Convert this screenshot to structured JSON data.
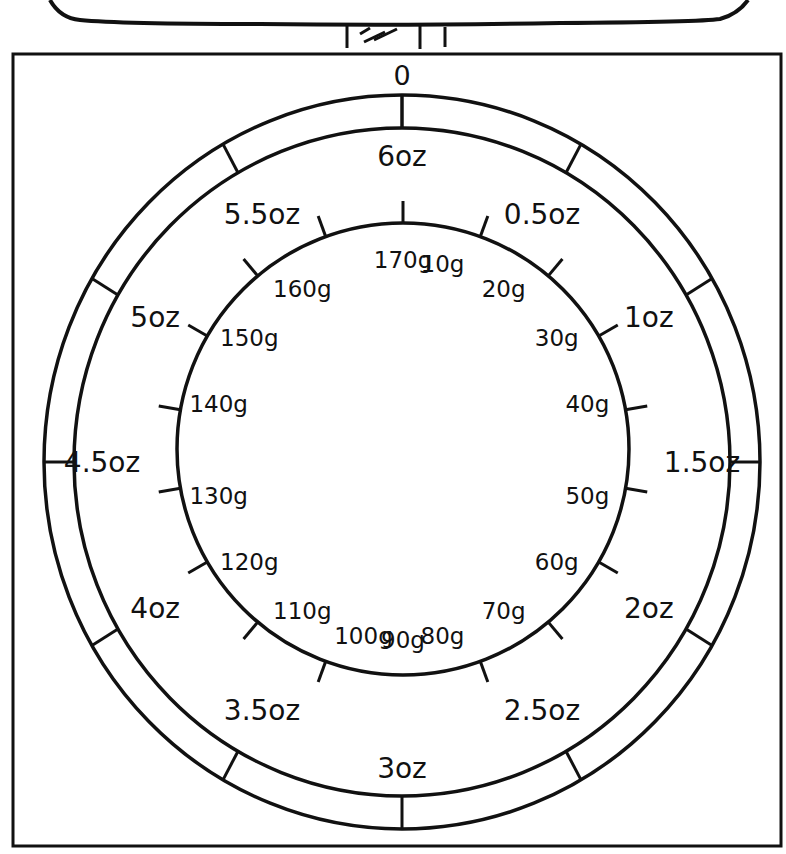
{
  "diagram": {
    "type": "kitchen-scale-dial",
    "zero_label": "0",
    "colors": {
      "ink": "#111111",
      "background": "#ffffff"
    },
    "outer_scale": {
      "unit": "oz",
      "labels": [
        "6oz",
        "0.5oz",
        "1oz",
        "1.5oz",
        "2oz",
        "2.5oz",
        "3oz",
        "3.5oz",
        "4oz",
        "4.5oz",
        "5oz",
        "5.5oz"
      ],
      "label_angles_deg": [
        0,
        30,
        60,
        90,
        120,
        150,
        180,
        210,
        240,
        270,
        300,
        330
      ],
      "tick_angles_deg": [
        0,
        30,
        60,
        90,
        120,
        150,
        180,
        210,
        240,
        270,
        300,
        330
      ]
    },
    "inner_scale": {
      "unit": "g",
      "labels": [
        "170g",
        "10g",
        "20g",
        "30g",
        "40g",
        "50g",
        "60g",
        "70g",
        "80g",
        "90g",
        "100g",
        "110g",
        "120g",
        "130g",
        "140g",
        "150g",
        "160g"
      ],
      "label_angles_deg": [
        0,
        20,
        40,
        60,
        80,
        100,
        120,
        140,
        160,
        180,
        200,
        220,
        240,
        260,
        280,
        300,
        320,
        340
      ],
      "tick_angles_deg": [
        0,
        20,
        40,
        60,
        80,
        100,
        120,
        140,
        160,
        200,
        220,
        240,
        260,
        280,
        300,
        320,
        340
      ]
    }
  }
}
